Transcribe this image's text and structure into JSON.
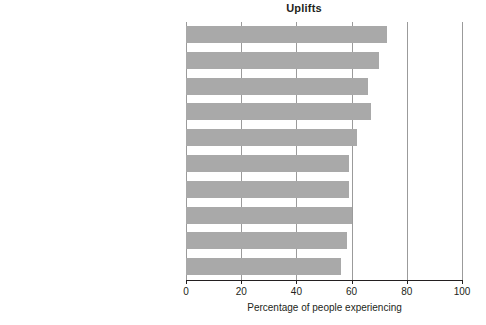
{
  "chart_data": {
    "type": "bar",
    "orientation": "horizontal",
    "title": "Uplifts",
    "xlabel": "Percentage of people experiencing",
    "ylabel": "",
    "xlim": [
      0,
      100
    ],
    "xticks": [
      0,
      20,
      40,
      60,
      80,
      100
    ],
    "xtick_labels": [
      "0",
      "20",
      "40",
      "60",
      "80",
      "100"
    ],
    "grid": true,
    "grid_axis": "x",
    "legend": null,
    "bar_color": "#a9a9a9",
    "axis_color": "#231f20",
    "categories": [
      "Relating well with spouse or lover",
      "Relating well with friends",
      "Completing a task",
      "Feeling healthy",
      "Getting enough sleep",
      "Eating out",
      "Meeting responsibilities",
      "Visiting, phoning, or writing someone",
      "Spending time with family",
      "Home (inside) pleasing to you"
    ],
    "values": [
      73,
      70,
      66,
      67,
      62,
      59,
      59,
      60,
      58.5,
      56
    ]
  }
}
